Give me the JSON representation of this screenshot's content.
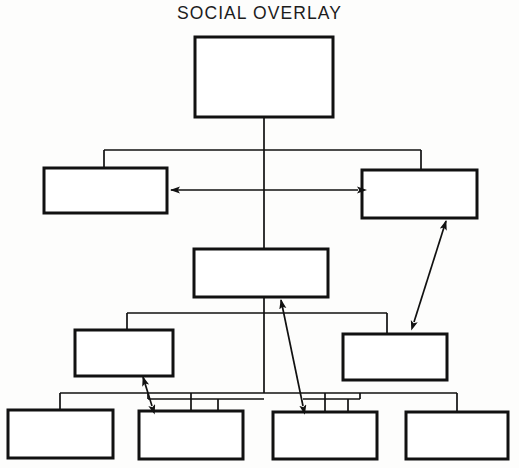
{
  "diagram": {
    "title": "SOCIAL OVERLAY",
    "type": "hierarchy-org-chart",
    "line_color": "#111111",
    "box_fill": "#ffffff",
    "background": "#fdfdfc",
    "node_labels_present": false,
    "levels": [
      {
        "level": 1,
        "nodes": [
          {
            "id": "n1",
            "label": "",
            "x": 195,
            "y": 37,
            "w": 138,
            "h": 80
          }
        ]
      },
      {
        "level": 2,
        "nodes": [
          {
            "id": "n2",
            "label": "",
            "x": 44,
            "y": 168,
            "w": 123,
            "h": 45
          },
          {
            "id": "n3",
            "label": "",
            "x": 362,
            "y": 170,
            "w": 115,
            "h": 48
          }
        ]
      },
      {
        "level": 3,
        "nodes": [
          {
            "id": "n4",
            "label": "",
            "x": 194,
            "y": 249,
            "w": 134,
            "h": 48
          }
        ]
      },
      {
        "level": 4,
        "nodes": [
          {
            "id": "n5",
            "label": "",
            "x": 75,
            "y": 330,
            "w": 98,
            "h": 46
          },
          {
            "id": "n6",
            "label": "",
            "x": 343,
            "y": 334,
            "w": 104,
            "h": 46
          }
        ]
      },
      {
        "level": 5,
        "nodes": [
          {
            "id": "n7",
            "label": "",
            "x": 8,
            "y": 410,
            "w": 105,
            "h": 48
          },
          {
            "id": "n8",
            "label": "",
            "x": 139,
            "y": 411,
            "w": 104,
            "h": 48
          },
          {
            "id": "n9",
            "label": "",
            "x": 273,
            "y": 412,
            "w": 104,
            "h": 47
          },
          {
            "id": "n10",
            "label": "",
            "x": 406,
            "y": 412,
            "w": 102,
            "h": 47
          }
        ]
      }
    ],
    "relationship_arrows": [
      {
        "id": "a1",
        "from": "n3",
        "to": "n2",
        "style": "double-headed",
        "orientation": "horizontal"
      },
      {
        "id": "a2",
        "from": "n6",
        "to": "n3",
        "style": "double-headed",
        "orientation": "diagonal"
      },
      {
        "id": "a3",
        "from": "n9",
        "to": "n4",
        "style": "double-headed",
        "orientation": "diagonal"
      },
      {
        "id": "a4",
        "from": "n8",
        "to": "n5",
        "style": "double-headed",
        "orientation": "diagonal"
      }
    ]
  }
}
